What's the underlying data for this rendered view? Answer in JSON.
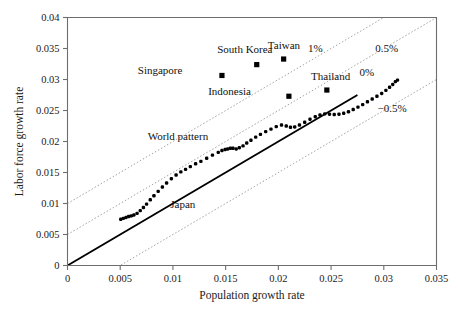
{
  "chart_data": {
    "type": "scatter",
    "title": "",
    "xlabel": "Population growth rate",
    "ylabel": "Labor force growth rate",
    "xlim": [
      0,
      0.035
    ],
    "ylim": [
      0,
      0.04
    ],
    "xticks": [
      "0",
      "0.005",
      "0.01",
      "0.015",
      "0.02",
      "0.025",
      "0.03",
      "0.035"
    ],
    "xtick_values": [
      0,
      0.005,
      0.01,
      0.015,
      0.02,
      0.025,
      0.03,
      0.035
    ],
    "yticks": [
      "0",
      "0.005",
      "0.01",
      "0.015",
      "0.02",
      "0.025",
      "0.03",
      "0.035",
      "0.04"
    ],
    "ytick_values": [
      0,
      0.005,
      0.01,
      0.015,
      0.02,
      0.025,
      0.03,
      0.035,
      0.04
    ],
    "grid": false,
    "legend_position": "none",
    "reference_lines": [
      {
        "label": "1%",
        "intercept": 0.01,
        "slope": 1,
        "style": "dotted",
        "label_x": 0.0228,
        "label_y": 0.0345
      },
      {
        "label": "0.5%",
        "intercept": 0.005,
        "slope": 1,
        "style": "dotted",
        "label_x": 0.0292,
        "label_y": 0.0345
      },
      {
        "label": "0%",
        "intercept": 0.0,
        "slope": 1,
        "style": "solid",
        "label_x": 0.0277,
        "label_y": 0.0305
      },
      {
        "label": "−0.5%",
        "intercept": -0.005,
        "slope": 1,
        "style": "dotted",
        "label_x": 0.0294,
        "label_y": 0.0248
      }
    ],
    "series": [
      {
        "name": "World pattern",
        "marker": "small-dot",
        "annotation": "World pattern",
        "annotation_x": 0.0123,
        "annotation_y": 0.0205,
        "points": [
          [
            0.00505,
            0.00745
          ],
          [
            0.0053,
            0.0076
          ],
          [
            0.00555,
            0.00775
          ],
          [
            0.0058,
            0.0079
          ],
          [
            0.00605,
            0.008
          ],
          [
            0.0063,
            0.00815
          ],
          [
            0.0066,
            0.0084
          ],
          [
            0.0069,
            0.00885
          ],
          [
            0.0072,
            0.00935
          ],
          [
            0.0075,
            0.0099
          ],
          [
            0.00785,
            0.0106
          ],
          [
            0.0082,
            0.01125
          ],
          [
            0.0086,
            0.01195
          ],
          [
            0.009,
            0.01265
          ],
          [
            0.0094,
            0.0133
          ],
          [
            0.00985,
            0.014
          ],
          [
            0.0103,
            0.0146
          ],
          [
            0.01075,
            0.0151
          ],
          [
            0.0112,
            0.0155
          ],
          [
            0.01165,
            0.01595
          ],
          [
            0.01215,
            0.0164
          ],
          [
            0.01265,
            0.0168
          ],
          [
            0.0132,
            0.0173
          ],
          [
            0.01375,
            0.0178
          ],
          [
            0.0143,
            0.01825
          ],
          [
            0.01465,
            0.01855
          ],
          [
            0.01495,
            0.0187
          ],
          [
            0.0152,
            0.0188
          ],
          [
            0.01545,
            0.0189
          ],
          [
            0.0157,
            0.0189
          ],
          [
            0.016,
            0.0188
          ],
          [
            0.0163,
            0.019
          ],
          [
            0.01665,
            0.0193
          ],
          [
            0.017,
            0.01975
          ],
          [
            0.0174,
            0.0202
          ],
          [
            0.01785,
            0.0207
          ],
          [
            0.0183,
            0.02115
          ],
          [
            0.0188,
            0.0216
          ],
          [
            0.0193,
            0.022
          ],
          [
            0.0198,
            0.0224
          ],
          [
            0.0203,
            0.02265
          ],
          [
            0.02075,
            0.0225
          ],
          [
            0.02115,
            0.0223
          ],
          [
            0.02155,
            0.02235
          ],
          [
            0.022,
            0.02265
          ],
          [
            0.0225,
            0.0231
          ],
          [
            0.023,
            0.0236
          ],
          [
            0.0235,
            0.024
          ],
          [
            0.02395,
            0.0243
          ],
          [
            0.0244,
            0.02445
          ],
          [
            0.02485,
            0.0244
          ],
          [
            0.0253,
            0.02435
          ],
          [
            0.02575,
            0.0244
          ],
          [
            0.0262,
            0.02455
          ],
          [
            0.02665,
            0.0248
          ],
          [
            0.0271,
            0.02515
          ],
          [
            0.02755,
            0.02555
          ],
          [
            0.028,
            0.02595
          ],
          [
            0.02845,
            0.0264
          ],
          [
            0.0289,
            0.02685
          ],
          [
            0.02935,
            0.0273
          ],
          [
            0.0298,
            0.02775
          ],
          [
            0.0302,
            0.02825
          ],
          [
            0.03055,
            0.02875
          ],
          [
            0.03085,
            0.0292
          ],
          [
            0.0311,
            0.02965
          ],
          [
            0.0313,
            0.0299
          ]
        ]
      }
    ],
    "country_points": [
      {
        "name": "South Korea",
        "x": 0.01795,
        "y": 0.0324,
        "label_x": 0.0142,
        "label_y": 0.0342,
        "label_align": "start"
      },
      {
        "name": "Taiwan",
        "x": 0.0205,
        "y": 0.0333,
        "label_x": 0.019,
        "label_y": 0.035,
        "label_align": "start"
      },
      {
        "name": "Singapore",
        "x": 0.01465,
        "y": 0.03065,
        "label_x": 0.0109,
        "label_y": 0.03085,
        "label_align": "end"
      },
      {
        "name": "Indonesia",
        "x": 0.021,
        "y": 0.0273,
        "label_x": 0.0174,
        "label_y": 0.0275,
        "label_align": "end"
      },
      {
        "name": "Thailand",
        "x": 0.0246,
        "y": 0.0283,
        "label_x": 0.0231,
        "label_y": 0.0299,
        "label_align": "start"
      }
    ],
    "annotations": [
      {
        "text": "Japan",
        "x": 0.00975,
        "y": 0.0093,
        "role": "solid-line-label"
      },
      {
        "text": "World pattern",
        "x": 0.0076,
        "y": 0.0203,
        "role": "scatter-label"
      }
    ]
  }
}
